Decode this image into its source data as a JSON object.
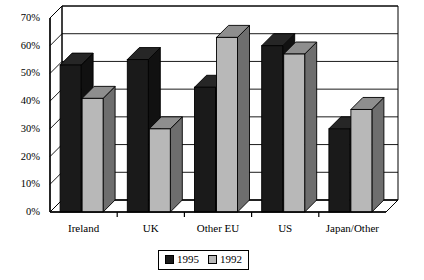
{
  "chart_data": {
    "type": "bar",
    "title": "",
    "subtitle": "",
    "xlabel": "",
    "ylabel": "",
    "categories": [
      "Ireland",
      "UK",
      "Other EU",
      "US",
      "Japan/Other"
    ],
    "series": [
      {
        "name": "1995",
        "color": "#1a1a1a",
        "values": [
          53,
          55,
          45,
          60,
          30
        ]
      },
      {
        "name": "1992",
        "color": "#b8b8b8",
        "values": [
          41,
          30,
          63,
          57,
          37
        ]
      }
    ],
    "ylim": [
      0,
      70
    ],
    "ytick_values": [
      0,
      10,
      20,
      30,
      40,
      50,
      60,
      70
    ],
    "ytick_labels": [
      "0%",
      "10%",
      "20%",
      "30%",
      "40%",
      "50%",
      "60%",
      "70%"
    ],
    "grid": true,
    "grid_axis": "y",
    "legend_position": "bottom",
    "style": "3d-column",
    "annotations": []
  },
  "legend": {
    "entries": [
      {
        "label": "1995",
        "swatch": "black-swatch-icon"
      },
      {
        "label": "1992",
        "swatch": "gray-swatch-icon"
      }
    ]
  }
}
